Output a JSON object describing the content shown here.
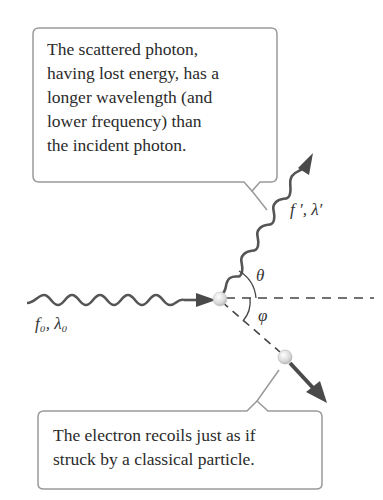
{
  "callouts": {
    "scattered_photon": {
      "text": "The scattered photon,\nhaving lost energy, has a\nlonger wavelength (and\nlower frequency) than\nthe incident photon."
    },
    "electron": {
      "text": "The electron recoils just as if\nstruck by a classical particle."
    }
  },
  "labels": {
    "incident": "f₀, λ₀",
    "scattered": "f ′, λ′",
    "theta": "θ",
    "phi": "φ"
  },
  "colors": {
    "wave": "#555555",
    "arrow": "#4a4a4a",
    "box_border": "#9a9a9a",
    "electron": "#dcdcdc",
    "text": "#2b2b2b"
  }
}
